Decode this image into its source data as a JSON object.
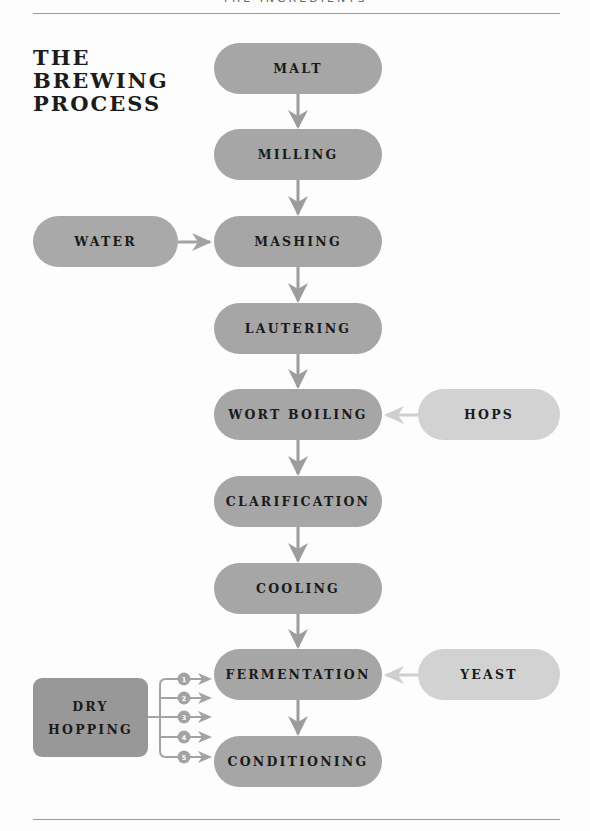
{
  "header": {
    "section_title": "THE INGREDIENTS"
  },
  "title": {
    "lines": [
      "THE",
      "BREWING",
      "PROCESS"
    ]
  },
  "process_steps": [
    {
      "label": "MALT"
    },
    {
      "label": "MILLING"
    },
    {
      "label": "MASHING"
    },
    {
      "label": "LAUTERING"
    },
    {
      "label": "WORT BOILING"
    },
    {
      "label": "CLARIFICATION"
    },
    {
      "label": "COOLING"
    },
    {
      "label": "FERMENTATION"
    },
    {
      "label": "CONDITIONING"
    }
  ],
  "inputs": {
    "water": {
      "label": "WATER",
      "feeds": "MASHING"
    },
    "hops": {
      "label": "HOPS",
      "feeds": "WORT BOILING"
    },
    "yeast": {
      "label": "YEAST",
      "feeds": "FERMENTATION"
    }
  },
  "dry_hopping": {
    "lines": [
      "DRY",
      "HOPPING"
    ],
    "stages": [
      "1",
      "2",
      "3",
      "4",
      "5"
    ]
  },
  "colors": {
    "main_step": "#a6a6a6",
    "water": "#a9a9a9",
    "hops_yeast": "#d2d2d2",
    "dry_hopping": "#989898",
    "arrow_dark": "#9c9c9c",
    "arrow_light": "#cfcfcf"
  }
}
